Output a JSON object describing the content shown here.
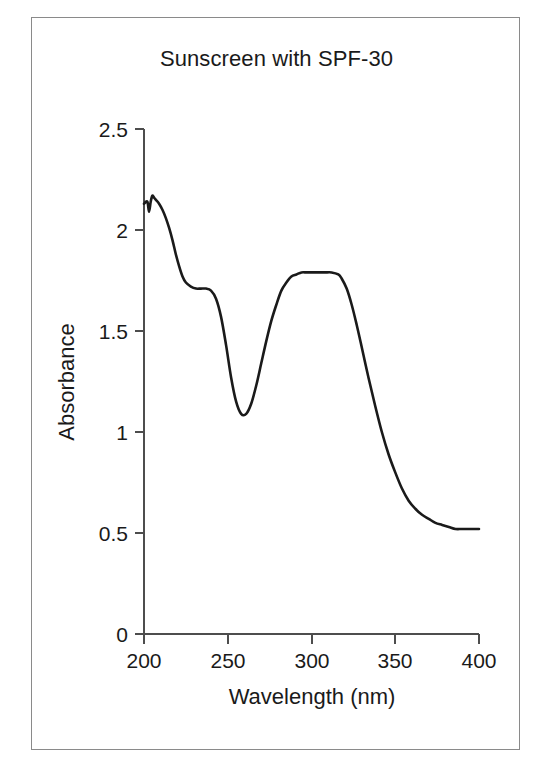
{
  "figure": {
    "title": "Sunscreen with SPF-30",
    "background_color": "#ffffff",
    "border_color": "#8a8a8a",
    "line_color": "#1a1a1a",
    "axis_color": "#4d4d4d"
  },
  "chart_data": {
    "type": "line",
    "title": "Sunscreen with SPF-30",
    "xlabel": "Wavelength (nm)",
    "ylabel": "Absorbance",
    "xlim": [
      200,
      400
    ],
    "ylim": [
      0,
      2.5
    ],
    "xticks": [
      200,
      250,
      300,
      350,
      400
    ],
    "xtick_labels": [
      "200",
      "250",
      "300",
      "350",
      "400"
    ],
    "yticks": [
      0,
      0.5,
      1,
      1.5,
      2,
      2.5
    ],
    "ytick_labels": [
      "0",
      "0.5",
      "1",
      "1.5",
      "2",
      "2.5"
    ],
    "grid": false,
    "legend": false,
    "legend_position": "none",
    "series": [
      {
        "name": "Absorbance spectrum",
        "x": [
          200,
          202,
          203,
          204,
          205,
          206,
          207,
          209,
          211,
          213,
          215,
          217,
          219,
          221,
          223,
          225,
          228,
          231,
          234,
          237,
          240,
          243,
          246,
          249,
          252,
          255,
          258,
          261,
          264,
          267,
          270,
          273,
          276,
          279,
          282,
          285,
          288,
          291,
          294,
          297,
          300,
          304,
          308,
          312,
          316,
          318,
          321,
          324,
          327,
          330,
          334,
          338,
          342,
          346,
          350,
          354,
          358,
          362,
          366,
          370,
          374,
          378,
          382,
          386,
          390,
          395,
          400
        ],
        "y": [
          2.13,
          2.14,
          2.09,
          2.14,
          2.17,
          2.16,
          2.15,
          2.13,
          2.1,
          2.06,
          2.01,
          1.95,
          1.88,
          1.82,
          1.77,
          1.74,
          1.72,
          1.71,
          1.71,
          1.71,
          1.7,
          1.66,
          1.57,
          1.43,
          1.27,
          1.15,
          1.09,
          1.09,
          1.14,
          1.23,
          1.34,
          1.45,
          1.55,
          1.63,
          1.7,
          1.74,
          1.77,
          1.78,
          1.79,
          1.79,
          1.79,
          1.79,
          1.79,
          1.79,
          1.78,
          1.76,
          1.71,
          1.63,
          1.53,
          1.42,
          1.27,
          1.13,
          1.0,
          0.89,
          0.8,
          0.72,
          0.66,
          0.62,
          0.59,
          0.57,
          0.55,
          0.54,
          0.53,
          0.52,
          0.52,
          0.52,
          0.52
        ]
      }
    ],
    "annotations": {
      "peak_1_wavelength": 205,
      "peak_1_absorbance": 2.17,
      "shoulder_wavelength": 237,
      "shoulder_absorbance": 1.71,
      "minimum_wavelength": 259,
      "minimum_absorbance": 1.09,
      "peak_2_wavelength": 305,
      "peak_2_absorbance": 1.79,
      "tail_absorbance": 0.52
    }
  }
}
